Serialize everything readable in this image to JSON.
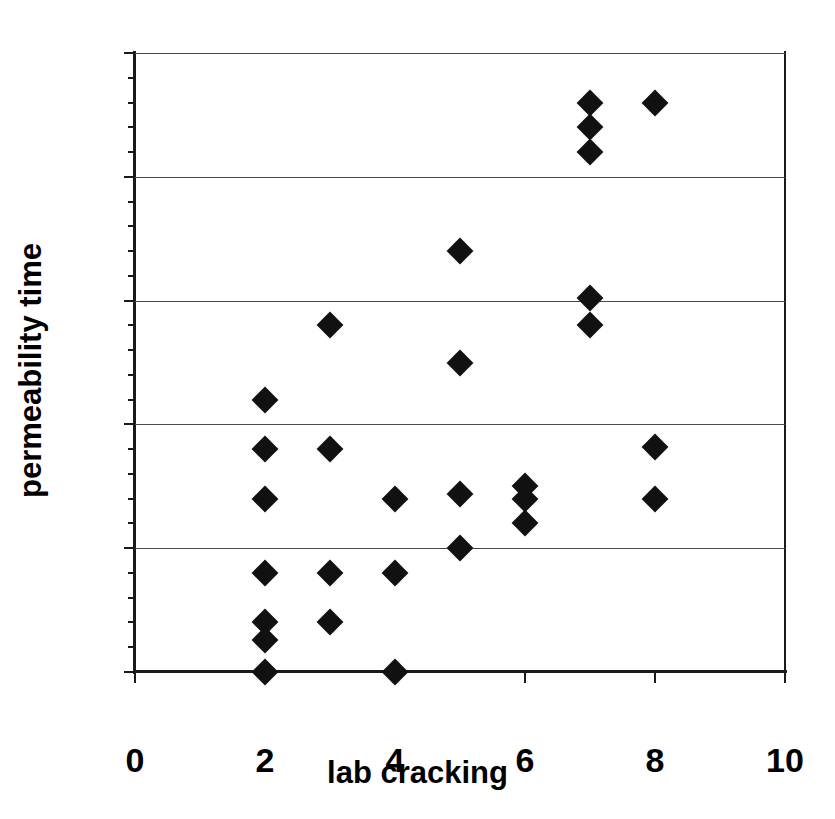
{
  "chart_data": {
    "type": "scatter",
    "title": "",
    "xlabel": "lab cracking",
    "ylabel": "permeability time",
    "xlim": [
      0,
      10
    ],
    "ylim": [
      0,
      25
    ],
    "xticks": [
      0,
      2,
      4,
      6,
      8,
      10
    ],
    "xtick_labels": [
      "0",
      "2",
      "4",
      "6",
      "8",
      "10"
    ],
    "yticks": [
      0,
      5,
      10,
      15,
      20,
      25
    ],
    "ytick_labels": [
      "0",
      "5",
      "10",
      "15",
      "20",
      "25"
    ],
    "y_minor_ticks": [
      1,
      2,
      3,
      4,
      6,
      7,
      8,
      9,
      11,
      12,
      13,
      14,
      16,
      17,
      18,
      19,
      21,
      22,
      23,
      24
    ],
    "gridlines": [
      5,
      10,
      15,
      20,
      25
    ],
    "grid": "horizontal",
    "legend": "none",
    "marker": "diamond",
    "marker_color": "#111111",
    "series": [
      {
        "name": "permeability time vs lab cracking",
        "points": [
          [
            2,
            11
          ],
          [
            2,
            9
          ],
          [
            2,
            7
          ],
          [
            2,
            4
          ],
          [
            2,
            2
          ],
          [
            2,
            1.3
          ],
          [
            2,
            0
          ],
          [
            3,
            14
          ],
          [
            3,
            9
          ],
          [
            3,
            4
          ],
          [
            3,
            2
          ],
          [
            4,
            7
          ],
          [
            4,
            4
          ],
          [
            4,
            0
          ],
          [
            5,
            17
          ],
          [
            5,
            12.5
          ],
          [
            5,
            7.2
          ],
          [
            5,
            5
          ],
          [
            6,
            7.5
          ],
          [
            6,
            7
          ],
          [
            6,
            6
          ],
          [
            7,
            23
          ],
          [
            7,
            22
          ],
          [
            7,
            21
          ],
          [
            7,
            15.1
          ],
          [
            7,
            14
          ],
          [
            8,
            23
          ],
          [
            8,
            9.1
          ],
          [
            8,
            7
          ]
        ]
      }
    ]
  }
}
